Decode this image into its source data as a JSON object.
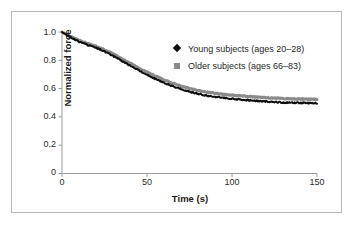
{
  "figure": {
    "border_color": "#b9b9b9",
    "background": "#ffffff"
  },
  "axes": {
    "x_title": "Time (s)",
    "y_title": "Normalized force",
    "x_ticks": [
      "0",
      "50",
      "100",
      "150"
    ],
    "y_ticks": [
      "0",
      "0.2",
      "0.4",
      "0.6",
      "0.8",
      "1.0"
    ]
  },
  "legend": {
    "entries": [
      {
        "marker": "diamond-marker",
        "color": "#0d0d0d",
        "label": "Young subjects (ages 20–28)"
      },
      {
        "marker": "square-marker",
        "color": "#8a8a8a",
        "label": "Older subjects (ages 66–83)"
      }
    ]
  },
  "chart_data": {
    "type": "line",
    "title": "",
    "xlabel": "Time (s)",
    "ylabel": "Normalized force",
    "xlim": [
      0,
      150
    ],
    "ylim": [
      0,
      1.0
    ],
    "xticks": [
      0,
      50,
      100,
      150
    ],
    "yticks": [
      0,
      0.2,
      0.4,
      0.6,
      0.8,
      1.0
    ],
    "grid": false,
    "legend_position": "upper-right-inside",
    "x": [
      0,
      5,
      10,
      15,
      20,
      25,
      30,
      35,
      40,
      45,
      50,
      55,
      60,
      65,
      70,
      75,
      80,
      85,
      90,
      95,
      100,
      105,
      110,
      115,
      120,
      125,
      130,
      135,
      140,
      145,
      150
    ],
    "series": [
      {
        "name": "Young subjects (ages 20–28)",
        "color": "#0d0d0d",
        "marker": "diamond",
        "values": [
          1.0,
          0.963,
          0.932,
          0.908,
          0.889,
          0.862,
          0.831,
          0.797,
          0.763,
          0.729,
          0.697,
          0.668,
          0.641,
          0.617,
          0.596,
          0.578,
          0.563,
          0.551,
          0.542,
          0.535,
          0.529,
          0.523,
          0.518,
          0.513,
          0.509,
          0.505,
          0.502,
          0.5,
          0.499,
          0.498,
          0.498
        ]
      },
      {
        "name": "Older subjects (ages 66–83)",
        "color": "#8a8a8a",
        "marker": "square",
        "values": [
          1.0,
          0.969,
          0.941,
          0.919,
          0.899,
          0.874,
          0.845,
          0.813,
          0.78,
          0.747,
          0.716,
          0.688,
          0.661,
          0.638,
          0.618,
          0.601,
          0.587,
          0.576,
          0.567,
          0.56,
          0.554,
          0.549,
          0.544,
          0.54,
          0.536,
          0.533,
          0.53,
          0.528,
          0.526,
          0.525,
          0.524
        ]
      }
    ]
  }
}
